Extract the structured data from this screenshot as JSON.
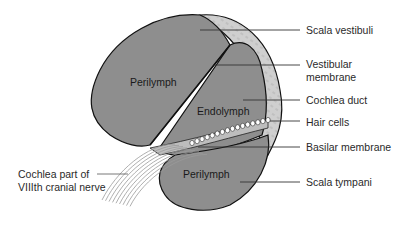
{
  "figure": {
    "region_labels": {
      "perilymph_upper": "Perilymph",
      "endolymph": "Endolymph",
      "perilymph_lower": "Perilymph"
    },
    "callouts": [
      {
        "id": "scala-vestibuli",
        "lines": [
          "Scala vestibuli"
        ]
      },
      {
        "id": "vestibular-membrane",
        "lines": [
          "Vestibular",
          "membrane"
        ]
      },
      {
        "id": "cochlea-duct",
        "lines": [
          "Cochlea duct"
        ]
      },
      {
        "id": "hair-cells",
        "lines": [
          "Hair cells"
        ]
      },
      {
        "id": "basilar-membrane",
        "lines": [
          "Basilar membrane"
        ]
      },
      {
        "id": "scala-tympani",
        "lines": [
          "Scala tympani"
        ]
      }
    ],
    "nerve_label": [
      "Cochlea part of",
      "VIIIth cranial nerve"
    ],
    "colors": {
      "fluid_fill": "#8e8e8e",
      "bone_fill": "#cfcfcf",
      "outline": "#111111",
      "hair_cell_fill": "#ffffff",
      "nerve_stroke": "#9a9a9a"
    }
  }
}
